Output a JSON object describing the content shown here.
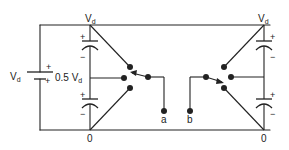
{
  "diagram": {
    "colors": {
      "wire": "#222222",
      "background": "#ffffff"
    },
    "labels": {
      "source": {
        "main": "V",
        "sub": "d"
      },
      "midpoint": {
        "prefix": "0.5 V",
        "sub": "d"
      },
      "top_left": {
        "main": "V",
        "sub": "d"
      },
      "top_right": {
        "main": "V",
        "sub": "d"
      },
      "bottom_left": "0",
      "bottom_right": "0",
      "terminal_a": "a",
      "terminal_b": "b",
      "plus": "+",
      "minus": "−"
    },
    "components": [
      {
        "type": "dc-source",
        "label": "Vd"
      },
      {
        "type": "capacitor",
        "position": "left-upper"
      },
      {
        "type": "capacitor",
        "position": "left-lower"
      },
      {
        "type": "capacitor",
        "position": "right-upper"
      },
      {
        "type": "capacitor",
        "position": "right-lower"
      },
      {
        "type": "switch",
        "position": "left",
        "terminal": "a"
      },
      {
        "type": "switch",
        "position": "right",
        "terminal": "b"
      }
    ]
  }
}
